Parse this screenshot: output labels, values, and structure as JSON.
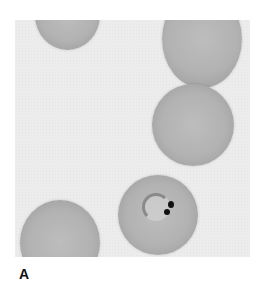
{
  "figure": {
    "panel_label": "A",
    "cells": [
      {
        "name": "rbc-top-left-partial"
      },
      {
        "name": "rbc-top-right-partial"
      },
      {
        "name": "rbc-middle-right"
      },
      {
        "name": "rbc-infected-bottom-center"
      },
      {
        "name": "rbc-bottom-left-partial"
      }
    ],
    "colors": {
      "background": "#ececec",
      "cell": "#b2b2b2",
      "chromatin": "#111111"
    }
  }
}
